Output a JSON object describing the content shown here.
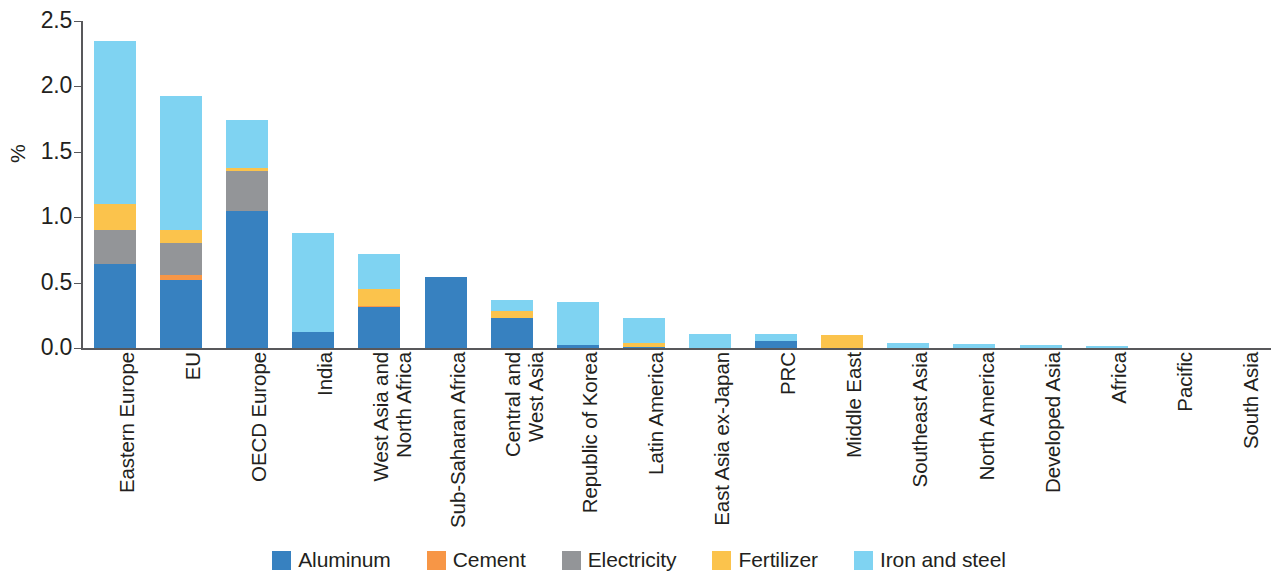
{
  "chart_data": {
    "type": "bar",
    "stacked": true,
    "title": "",
    "xlabel": "",
    "ylabel": "%",
    "ylim": [
      0.0,
      2.5
    ],
    "yticks": [
      0.0,
      0.5,
      1.0,
      1.5,
      2.0,
      2.5
    ],
    "ytick_labels": [
      "0.0",
      "0.5",
      "1.0",
      "1.5",
      "2.0",
      "2.5"
    ],
    "grid": false,
    "legend_position": "bottom",
    "categories": [
      "Eastern Europe",
      "EU",
      "OECD Europe",
      "India",
      "West Asia and\nNorth Africa",
      "Sub-Saharan Africa",
      "Central and\nWest Asia",
      "Republic of Korea",
      "Latin America",
      "East Asia ex-Japan",
      "PRC",
      "Middle East",
      "Southeast Asia",
      "North America",
      "Developed Asia",
      "Africa",
      "Pacific",
      "South Asia"
    ],
    "series": [
      {
        "name": "Aluminum",
        "color": "#3781c0",
        "values": [
          0.64,
          0.52,
          1.05,
          0.12,
          0.31,
          0.54,
          0.23,
          0.02,
          0.01,
          0.0,
          0.05,
          0.0,
          0.0,
          0.0,
          0.0,
          0.0,
          0.0,
          0.0
        ]
      },
      {
        "name": "Cement",
        "color": "#f79646",
        "values": [
          0.0,
          0.04,
          0.0,
          0.0,
          0.01,
          0.0,
          0.0,
          0.0,
          0.0,
          0.0,
          0.0,
          0.0,
          0.0,
          0.0,
          0.0,
          0.0,
          0.0,
          0.0
        ]
      },
      {
        "name": "Electricity",
        "color": "#939598",
        "values": [
          0.26,
          0.24,
          0.3,
          0.0,
          0.0,
          0.0,
          0.0,
          0.0,
          0.0,
          0.0,
          0.0,
          0.0,
          0.0,
          0.0,
          0.0,
          0.0,
          0.0,
          0.0
        ]
      },
      {
        "name": "Fertilizer",
        "color": "#fbc34c",
        "values": [
          0.2,
          0.1,
          0.03,
          0.0,
          0.13,
          0.0,
          0.05,
          0.0,
          0.03,
          0.0,
          0.0,
          0.1,
          0.0,
          0.0,
          0.0,
          0.0,
          0.0,
          0.0
        ]
      },
      {
        "name": "Iron and steel",
        "color": "#7fd3f2",
        "values": [
          1.25,
          1.03,
          0.36,
          0.76,
          0.27,
          0.0,
          0.09,
          0.33,
          0.19,
          0.11,
          0.06,
          0.0,
          0.035,
          0.03,
          0.025,
          0.012,
          0.0,
          0.0
        ]
      }
    ],
    "totals": [
      2.35,
      1.93,
      1.74,
      0.88,
      0.72,
      0.54,
      0.37,
      0.35,
      0.26,
      0.11,
      0.11,
      0.1,
      0.035,
      0.03,
      0.025,
      0.012,
      0.0,
      0.0
    ]
  },
  "legend": {
    "items": [
      {
        "label": "Aluminum",
        "color": "#3781c0"
      },
      {
        "label": "Cement",
        "color": "#f79646"
      },
      {
        "label": "Electricity",
        "color": "#939598"
      },
      {
        "label": "Fertilizer",
        "color": "#fbc34c"
      },
      {
        "label": "Iron and steel",
        "color": "#7fd3f2"
      }
    ]
  },
  "axis_color": "#58585b",
  "text_color": "#231f20"
}
